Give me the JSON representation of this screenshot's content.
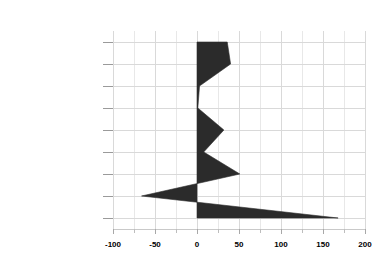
{
  "chart_data": {
    "type": "area",
    "orientation": "horizontal",
    "title": "",
    "subtitle": "",
    "xlabel": "",
    "ylabel": "",
    "categories": [
      "Services",
      "Fin, Ins, Real Est.",
      "Retail Trade",
      "Wholesale Trade",
      "Trans., Pub. Util.",
      "Manufacturing",
      "Construction",
      "Mining",
      "Ag. Services"
    ],
    "values": [
      36,
      40,
      3,
      1,
      32,
      8,
      51,
      -66,
      168
    ],
    "series": [
      {
        "name": "",
        "values": [
          36,
          40,
          3,
          1,
          32,
          8,
          51,
          -66,
          168
        ]
      }
    ],
    "xlim": [
      -100,
      200
    ],
    "xticks": [
      -100,
      -50,
      0,
      50,
      100,
      150,
      200
    ],
    "xticklabels": [
      "-100",
      "-50",
      "0",
      "50",
      "100",
      "150",
      "200"
    ],
    "x_minor_ticks": [
      -75,
      -25,
      25,
      75,
      125,
      175
    ],
    "grid": true,
    "legend": "none",
    "baseline": 0,
    "fill_color": "#2b2b2b",
    "grid_color": "#d9d9d9",
    "background_color": "#ffffff"
  }
}
